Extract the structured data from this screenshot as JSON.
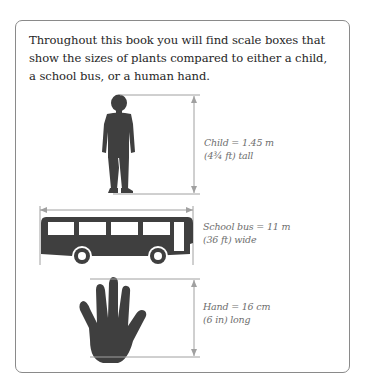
{
  "intro_text": "Throughout this book you will find scale boxes that show the sizes of plants compared to either a child, a school bus, or a human hand.",
  "scales": [
    {
      "name": "child",
      "line1": "Child = 1.45 m",
      "line2": "(4¾ ft) tall",
      "icon": "child-silhouette-icon"
    },
    {
      "name": "school-bus",
      "line1": "School bus = 11 m",
      "line2": "(36 ft) wide",
      "icon": "bus-silhouette-icon"
    },
    {
      "name": "hand",
      "line1": "Hand = 16 cm",
      "line2": "(6 in) long",
      "icon": "hand-silhouette-icon"
    }
  ],
  "colors": {
    "silhouette": "#3f3f3f",
    "measure_line": "#a0a0a0",
    "border": "#8a8a8a",
    "label_text": "#6e6e6e",
    "body_text": "#262626"
  }
}
